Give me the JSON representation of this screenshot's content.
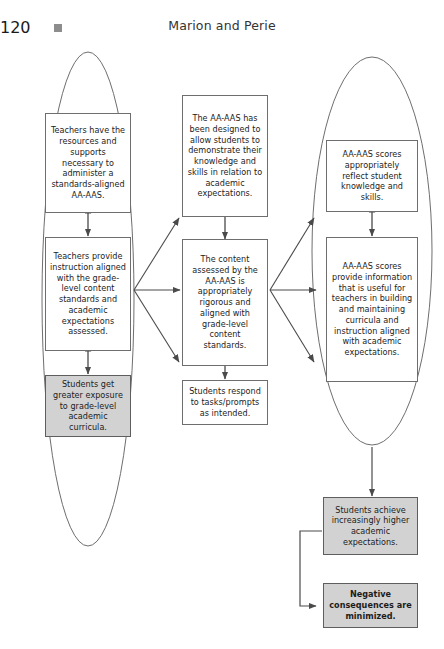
{
  "page": {
    "number": "120",
    "running_title": "Marion and Perie",
    "ornament_icon": "square-bullet-icon"
  },
  "figure": {
    "groupings": [
      {
        "name": "left-ellipse",
        "label": ""
      },
      {
        "name": "right-ellipse",
        "label": ""
      }
    ],
    "nodes": [
      {
        "id": "teachers-resources",
        "column": "left",
        "shaded": false,
        "bold": false,
        "text": "Teachers have the resources and supports necessary to administer a standards-aligned AA-AAS."
      },
      {
        "id": "teachers-instruction",
        "column": "left",
        "shaded": false,
        "bold": false,
        "text": "Teachers provide instruction aligned with the grade-level content standards and academic expectations assessed."
      },
      {
        "id": "students-exposure",
        "column": "left",
        "shaded": true,
        "bold": false,
        "text": "Students get greater exposure to grade-level academic curricula."
      },
      {
        "id": "aaas-designed",
        "column": "center",
        "shaded": false,
        "bold": false,
        "text": "The AA-AAS has been designed to allow students to demonstrate their knowledge and skills in relation to academic expectations."
      },
      {
        "id": "content-assessed",
        "column": "center",
        "shaded": false,
        "bold": false,
        "text": "The content assessed by the AA-AAS is appropriately rigorous and aligned with grade-level content standards."
      },
      {
        "id": "students-respond",
        "column": "center",
        "shaded": false,
        "bold": false,
        "text": "Students respond to tasks/prompts as intended."
      },
      {
        "id": "scores-reflect",
        "column": "right",
        "shaded": false,
        "bold": false,
        "text": "AA-AAS scores appropriately reflect student knowledge and skills."
      },
      {
        "id": "scores-inform",
        "column": "right",
        "shaded": false,
        "bold": false,
        "text": "AA-AAS scores provide information that is useful for teachers in building and maintaining curricula and instruction aligned with academic expectations."
      },
      {
        "id": "students-achieve",
        "column": "outcome",
        "shaded": true,
        "bold": false,
        "text": "Students achieve increasingly higher academic expectations."
      },
      {
        "id": "negative-consequences",
        "column": "outcome",
        "shaded": true,
        "bold": true,
        "text": "Negative consequences are minimized."
      }
    ],
    "colors": {
      "stroke": "#6e6e6e",
      "arrow": "#555555",
      "shaded_fill": "#d2d2d2",
      "page_background": "#ffffff",
      "text": "#1c1c1c"
    }
  }
}
